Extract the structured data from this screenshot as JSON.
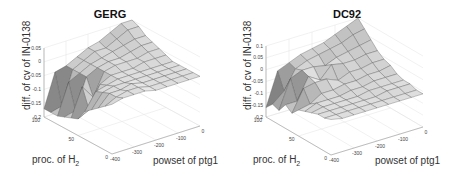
{
  "chart_data": [
    {
      "type": "surface3d",
      "title": "GERG",
      "xlabel": "powset of ptg1",
      "ylabel": "proc. of H",
      "ylabel_sub": "2",
      "zlabel": "diff. of cv of IN-0138",
      "xticks": [
        -400,
        -300,
        -200,
        -100,
        0
      ],
      "yticks": [
        0,
        50,
        100
      ],
      "zticks": [
        0.05,
        0,
        -0.05,
        -0.1,
        -0.15,
        -0.2
      ],
      "xlim": [
        -400,
        0
      ],
      "ylim": [
        0,
        100
      ],
      "zlim": [
        -0.2,
        0.05
      ],
      "x": [
        -400,
        -350,
        -300,
        -250,
        -200,
        -150,
        -100,
        -50,
        0
      ],
      "y": [
        100,
        90,
        80,
        70,
        60,
        50,
        40,
        30,
        20,
        10,
        0
      ],
      "z": [
        [
          -0.17,
          -0.17,
          -0.17,
          -0.16,
          -0.15,
          -0.14,
          -0.1,
          -0.08,
          -0.06,
          -0.04,
          -0.02
        ],
        [
          -0.05,
          -0.16,
          -0.06,
          -0.15,
          -0.05,
          -0.12,
          -0.04,
          -0.03,
          -0.02,
          -0.02,
          -0.01
        ],
        [
          -0.04,
          -0.04,
          -0.04,
          -0.04,
          -0.1,
          -0.04,
          -0.03,
          -0.02,
          -0.02,
          -0.01,
          -0.01
        ],
        [
          -0.02,
          -0.02,
          -0.02,
          -0.02,
          -0.02,
          -0.02,
          -0.02,
          -0.02,
          -0.01,
          -0.01,
          -0.01
        ],
        [
          0.0,
          0.0,
          -0.01,
          -0.01,
          -0.01,
          -0.02,
          -0.02,
          -0.02,
          -0.02,
          -0.02,
          -0.02
        ],
        [
          0.01,
          0.0,
          0.0,
          -0.01,
          -0.01,
          -0.02,
          -0.02,
          -0.02,
          -0.02,
          -0.02,
          -0.02
        ],
        [
          0.03,
          0.02,
          0.01,
          0.0,
          -0.01,
          -0.01,
          -0.02,
          -0.02,
          -0.02,
          -0.02,
          -0.02
        ],
        [
          0.05,
          0.04,
          0.02,
          0.01,
          0.0,
          -0.01,
          -0.02,
          -0.02,
          -0.02,
          -0.02,
          -0.02
        ],
        [
          0.05,
          0.04,
          0.02,
          0.01,
          0.0,
          -0.01,
          -0.02,
          -0.02,
          -0.02,
          -0.02,
          -0.02
        ]
      ]
    },
    {
      "type": "surface3d",
      "title": "DC92",
      "xlabel": "powset of ptg1",
      "ylabel": "proc. of H",
      "ylabel_sub": "2",
      "zlabel": "diff. of cv of IN-0138",
      "xticks": [
        -400,
        -300,
        -200,
        -100,
        0
      ],
      "yticks": [
        0,
        50,
        100
      ],
      "zticks": [
        0.1,
        0.05,
        0,
        -0.05,
        -0.1,
        -0.15,
        -0.2
      ],
      "xlim": [
        -400,
        0
      ],
      "ylim": [
        0,
        100
      ],
      "zlim": [
        -0.2,
        0.1
      ],
      "x": [
        -400,
        -350,
        -300,
        -250,
        -200,
        -150,
        -100,
        -50,
        0
      ],
      "y": [
        100,
        90,
        80,
        70,
        60,
        50,
        40,
        30,
        20,
        10,
        0
      ],
      "z": [
        [
          -0.16,
          -0.13,
          -0.14,
          -0.1,
          -0.12,
          -0.09,
          -0.08,
          -0.07,
          -0.06,
          -0.06,
          -0.05
        ],
        [
          -0.02,
          -0.09,
          -0.02,
          -0.1,
          -0.03,
          -0.08,
          -0.06,
          -0.06,
          -0.06,
          -0.06,
          -0.06
        ],
        [
          0.0,
          -0.01,
          0.0,
          -0.01,
          -0.02,
          -0.05,
          -0.06,
          -0.06,
          -0.06,
          -0.06,
          -0.06
        ],
        [
          0.02,
          0.01,
          0.0,
          -0.04,
          -0.02,
          -0.05,
          -0.06,
          -0.06,
          -0.06,
          -0.06,
          -0.06
        ],
        [
          0.03,
          0.02,
          -0.01,
          0.01,
          -0.04,
          -0.04,
          -0.05,
          -0.06,
          -0.06,
          -0.06,
          -0.06
        ],
        [
          0.04,
          0.03,
          0.01,
          0.0,
          -0.02,
          -0.04,
          -0.05,
          -0.05,
          -0.06,
          -0.06,
          -0.06
        ],
        [
          0.06,
          0.04,
          0.02,
          0.0,
          -0.02,
          -0.03,
          -0.04,
          -0.05,
          -0.05,
          -0.06,
          -0.06
        ],
        [
          0.08,
          0.06,
          0.03,
          0.01,
          -0.01,
          -0.03,
          -0.04,
          -0.05,
          -0.05,
          -0.06,
          -0.06
        ],
        [
          0.1,
          0.07,
          0.04,
          0.01,
          -0.01,
          -0.02,
          -0.04,
          -0.05,
          -0.05,
          -0.06,
          -0.06
        ]
      ]
    }
  ],
  "layout": [
    {
      "origin": [
        44,
        117
      ],
      "hvec": [
        68,
        37
      ],
      "xvec": [
        88,
        -28
      ],
      "zpx": 69
    },
    {
      "origin": [
        266,
        117
      ],
      "hvec": [
        65,
        38
      ],
      "xvec": [
        92,
        -28
      ],
      "zpx": 71
    }
  ]
}
